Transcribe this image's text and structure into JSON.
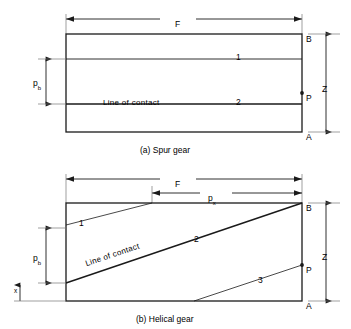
{
  "figure": {
    "title_hidden": "",
    "panels": [
      {
        "id": "spur",
        "caption": "(a) Spur gear",
        "dimensions": {
          "face_width": "F",
          "base_pitch": "p",
          "base_pitch_sub": "b",
          "zone": "Z"
        },
        "points": {
          "top": "B",
          "pitch": "P",
          "bottom": "A"
        },
        "contact_lines": [
          {
            "number": "1",
            "label": ""
          },
          {
            "number": "2",
            "label": "Line of contact"
          }
        ]
      },
      {
        "id": "helical",
        "caption": "(b) Helical gear",
        "dimensions": {
          "face_width": "F",
          "axial_pitch": "p",
          "axial_pitch_sub": "x",
          "base_pitch": "p",
          "base_pitch_sub": "b",
          "zone": "Z"
        },
        "points": {
          "top": "B",
          "pitch": "P",
          "bottom": "A"
        },
        "axis_label": "x",
        "contact_lines": [
          {
            "number": "1",
            "label": ""
          },
          {
            "number": "2",
            "label": "Line of contact"
          },
          {
            "number": "3",
            "label": ""
          }
        ]
      }
    ],
    "colors": {
      "stroke": "#1a1a1a",
      "thin_stroke": "#555555",
      "background": "#ffffff"
    }
  }
}
